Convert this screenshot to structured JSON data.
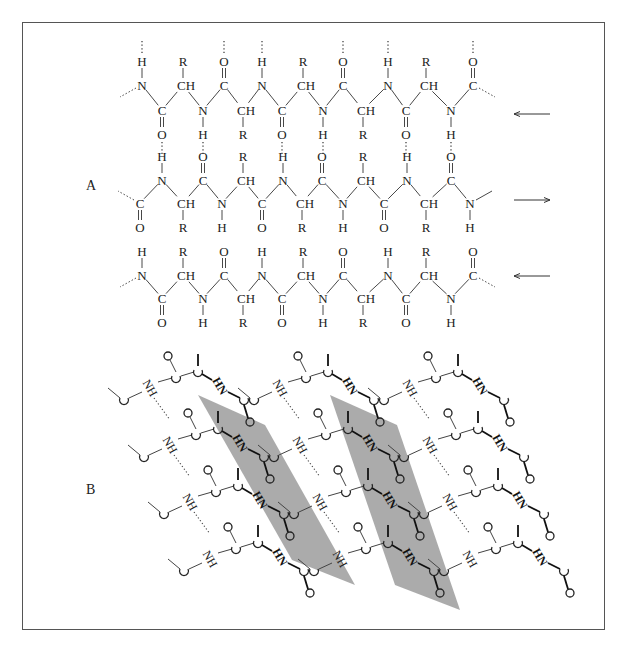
{
  "figure": {
    "panel_a_label": "A",
    "panel_b_label": "B",
    "colors": {
      "frame": "#555555",
      "ink": "#222222",
      "shade": "#a6a6a6"
    },
    "panel_a": {
      "description": "Antiparallel beta-pleated sheet, planar projection",
      "strands": [
        {
          "direction": "left",
          "arrow": "←"
        },
        {
          "direction": "right",
          "arrow": "→"
        },
        {
          "direction": "left",
          "arrow": "←"
        }
      ],
      "atoms": {
        "N": "N",
        "C": "C",
        "CH": "CH",
        "O": "O",
        "H": "H",
        "R": "R"
      }
    },
    "panel_b": {
      "description": "Pleated sheet in perspective with shaded planes",
      "groups": {
        "NH": "NH",
        "HN": "HN",
        "O": "O",
        "C": "C"
      }
    }
  }
}
